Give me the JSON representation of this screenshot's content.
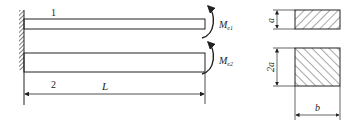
{
  "diagram": {
    "type": "mechanics-cantilever-beams-with-cross-sections",
    "beams": [
      {
        "id": "beam-1",
        "label": "1",
        "moment_label": "M",
        "moment_subscript": "e1"
      },
      {
        "id": "beam-2",
        "label": "2",
        "moment_label": "M",
        "moment_subscript": "e2"
      }
    ],
    "length_label": "L",
    "cross_sections": [
      {
        "id": "section-1",
        "height_label": "a",
        "hatch": "forward"
      },
      {
        "id": "section-2",
        "height_label": "2a",
        "width_label": "b",
        "hatch": "backward"
      }
    ],
    "colors": {
      "line": "#222222",
      "background": "#ffffff"
    }
  }
}
